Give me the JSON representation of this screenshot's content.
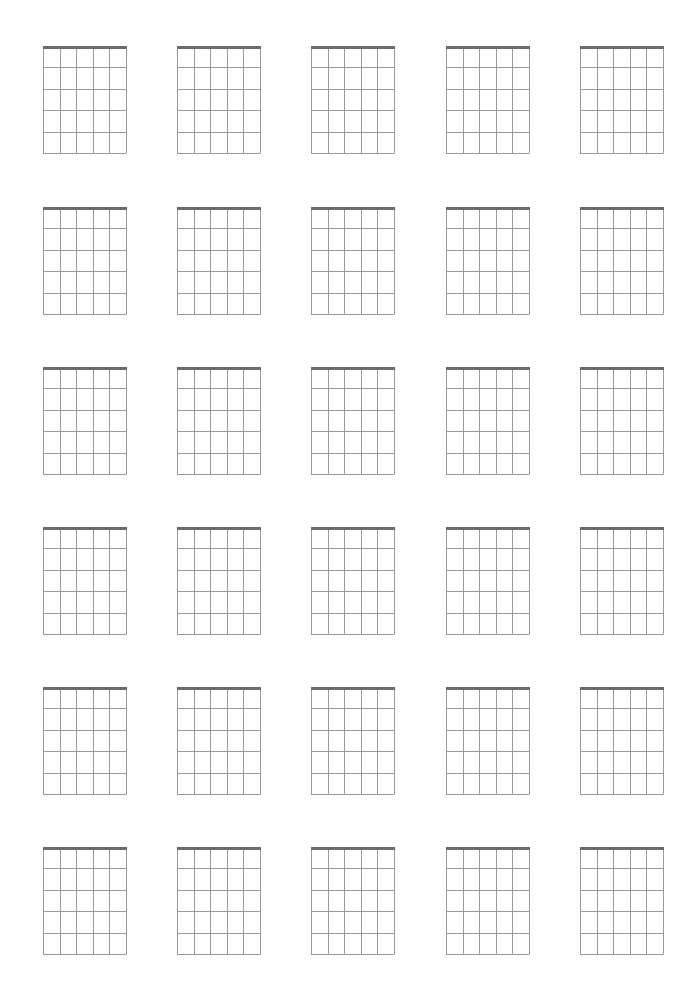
{
  "page": {
    "title": "",
    "background": "#ffffff"
  },
  "sheet": {
    "type": "blank-guitar-chord-diagrams",
    "rows": 6,
    "columns": 5,
    "strings": 6,
    "frets_shown": 5,
    "column_x": [
      43,
      177,
      311,
      446,
      580
    ],
    "row_y": [
      46,
      207,
      367,
      527,
      687,
      847
    ],
    "grid_width": 83,
    "grid_height": 107,
    "line_color": "#9a9a9a",
    "nut_color": "#6b6b6b",
    "line_width": 1,
    "nut_width": 3
  }
}
